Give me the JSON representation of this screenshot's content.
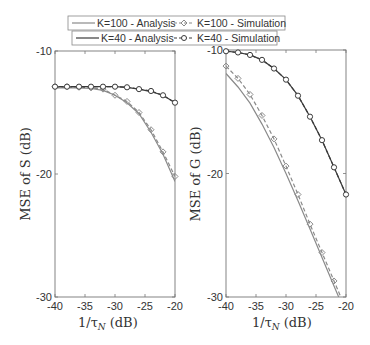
{
  "chart_data": [
    {
      "type": "line",
      "panel": "left",
      "title": "",
      "xlabel": "1/τ_N (dB)",
      "ylabel": "MSE of S (dB)",
      "xlim": [
        -40,
        -20
      ],
      "ylim": [
        -30,
        -10
      ],
      "xticks": [
        -40,
        -35,
        -30,
        -25,
        -20
      ],
      "yticks": [
        -10,
        -20,
        -30
      ],
      "grid": false,
      "x": [
        -40,
        -38,
        -36,
        -34,
        -32,
        -30,
        -28,
        -26,
        -24,
        -22,
        -20
      ],
      "series": [
        {
          "name": "K=100 - Analysis",
          "style": "solid",
          "values": [
            -13.0,
            -13.0,
            -13.0,
            -13.05,
            -13.2,
            -13.6,
            -14.2,
            -15.1,
            -16.6,
            -18.4,
            -20.6
          ]
        },
        {
          "name": "K=100 - Simulation",
          "style": "dashed-diamond",
          "values": [
            -12.9,
            -12.9,
            -12.95,
            -13.0,
            -13.1,
            -13.6,
            -14.1,
            -15.0,
            -16.4,
            -18.2,
            -20.2
          ]
        },
        {
          "name": "K=40 - Analysis",
          "style": "solid",
          "values": [
            -12.9,
            -12.9,
            -12.9,
            -12.9,
            -12.9,
            -12.9,
            -12.95,
            -13.1,
            -13.3,
            -13.6,
            -14.2
          ]
        },
        {
          "name": "K=40 - Simulation",
          "style": "dashed-circle",
          "values": [
            -12.9,
            -12.9,
            -12.9,
            -12.9,
            -12.9,
            -12.9,
            -12.95,
            -13.1,
            -13.25,
            -13.6,
            -14.2
          ]
        }
      ]
    },
    {
      "type": "line",
      "panel": "right",
      "title": "",
      "xlabel": "1/τ_N (dB)",
      "ylabel": "MSE of G (dB)",
      "xlim": [
        -40,
        -20
      ],
      "ylim": [
        -30,
        -10
      ],
      "xticks": [
        -40,
        -35,
        -30,
        -25,
        -20
      ],
      "yticks": [
        -10,
        -20,
        -30
      ],
      "grid": false,
      "x": [
        -40,
        -38,
        -36,
        -34,
        -32,
        -30,
        -28,
        -26,
        -24,
        -22,
        -20
      ],
      "series": [
        {
          "name": "K=100 - Analysis",
          "style": "solid",
          "values": [
            -11.9,
            -13.0,
            -14.3,
            -16.0,
            -17.9,
            -20.0,
            -22.2,
            -24.5,
            -26.8,
            -29.1,
            -31.4
          ]
        },
        {
          "name": "K=100 - Simulation",
          "style": "dashed-diamond",
          "values": [
            -11.3,
            -12.3,
            -13.6,
            -15.3,
            -17.2,
            -19.4,
            -21.7,
            -24.1,
            -26.4,
            -28.7,
            -31.0
          ]
        },
        {
          "name": "K=40 - Analysis",
          "style": "solid",
          "values": [
            -10.1,
            -10.2,
            -10.4,
            -10.8,
            -11.5,
            -12.4,
            -13.7,
            -15.4,
            -17.3,
            -19.5,
            -21.7
          ]
        },
        {
          "name": "K=40 - Simulation",
          "style": "dashed-circle",
          "values": [
            -10.1,
            -10.2,
            -10.4,
            -10.8,
            -11.5,
            -12.4,
            -13.7,
            -15.4,
            -17.3,
            -19.5,
            -21.7
          ]
        }
      ]
    }
  ],
  "legend": {
    "row1": {
      "analysis": "K=100 - Analysis",
      "simulation": "K=100 - Simulation"
    },
    "row2": {
      "analysis": "K=40 - Analysis",
      "simulation": "K=40 - Simulation"
    }
  },
  "axes": {
    "left": {
      "ylabel": "MSE of S (dB)",
      "xlabel_main": "1/τ",
      "xlabel_sub": "N",
      "xlabel_unit": "(dB)"
    },
    "right": {
      "ylabel": "MSE of G (dB)",
      "xlabel_main": "1/τ",
      "xlabel_sub": "N",
      "xlabel_unit": "(dB)"
    }
  },
  "colors": {
    "k100": "#8a8a8a",
    "k40": "#3a3a3a",
    "axis": "#777777",
    "text": "#333333"
  }
}
